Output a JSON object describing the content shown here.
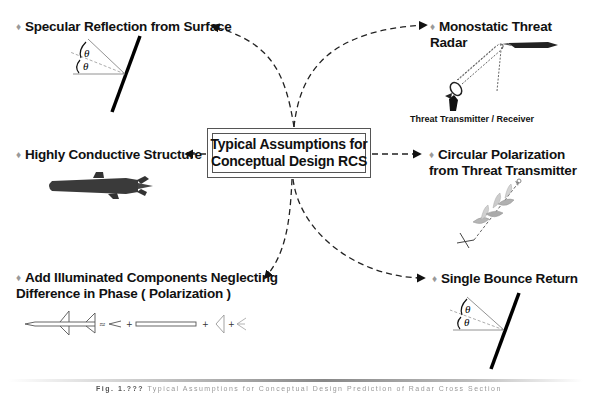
{
  "center": {
    "line1": "Typical Assumptions for",
    "line2": "Conceptual Design RCS"
  },
  "assumptions": [
    {
      "id": "specular",
      "bullet": "♦",
      "lines": [
        "Specular Reflection from Surface"
      ],
      "illustration": "reflection-angle-diagram",
      "angle_symbol": "θ"
    },
    {
      "id": "monostatic",
      "bullet": "♦",
      "lines": [
        "Monostatic Threat",
        "Radar"
      ],
      "illustration": "radar-and-missile",
      "sublabel": "Threat Transmitter / Receiver"
    },
    {
      "id": "conductive",
      "bullet": "♦",
      "lines": [
        "Highly Conductive Structure"
      ],
      "illustration": "missile-silhouette"
    },
    {
      "id": "circular",
      "bullet": "♦",
      "lines": [
        "Circular Polarization",
        "from Threat Transmitter"
      ],
      "illustration": "circular-polarization-wave"
    },
    {
      "id": "components",
      "bullet": "♦",
      "lines": [
        "Add Illuminated Components Neglecting",
        "Difference in Phase ( Polarization )"
      ],
      "illustration": "missile-component-decomposition",
      "operators": [
        "≈",
        "+",
        "+",
        "+"
      ]
    },
    {
      "id": "single-bounce",
      "bullet": "♦",
      "lines": [
        "Single Bounce Return"
      ],
      "illustration": "reflection-angle-diagram",
      "angle_symbol": "θ"
    }
  ],
  "caption": {
    "prefix": "Fig. 1.???",
    "text": "Typical Assumptions for Conceptual Design Prediction of Radar Cross Section"
  },
  "colors": {
    "text": "#111111",
    "bullet": "#9a9a9a",
    "line": "#111111",
    "box_border": "#555555",
    "background": "#ffffff"
  }
}
